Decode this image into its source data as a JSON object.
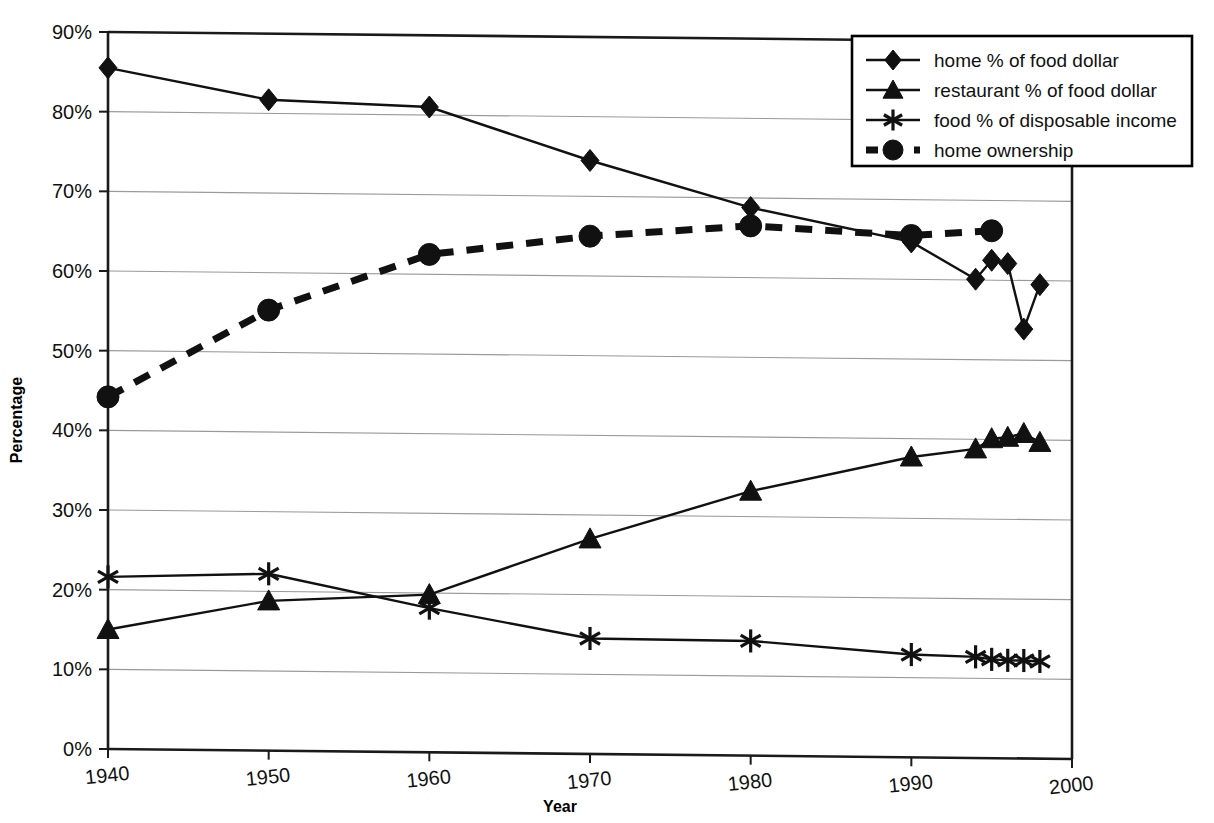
{
  "chart_data": {
    "type": "line",
    "title": "",
    "xlabel": "Year",
    "ylabel": "Percentage",
    "xlim": [
      1940,
      2000
    ],
    "ylim": [
      0,
      90
    ],
    "grid": true,
    "legend_position": "top-right",
    "x_ticks": [
      "1940",
      "1950",
      "1960",
      "1970",
      "1980",
      "1990",
      "2000"
    ],
    "y_ticks": [
      "0%",
      "10%",
      "20%",
      "30%",
      "40%",
      "50%",
      "60%",
      "70%",
      "80%",
      "90%"
    ],
    "series": [
      {
        "name": "home % of food dollar",
        "marker": "diamond",
        "style": "solid",
        "x": [
          1940,
          1950,
          1960,
          1970,
          1980,
          1990,
          1994,
          1995,
          1996,
          1997,
          1998
        ],
        "values": [
          85.5,
          81.7,
          81.0,
          74.5,
          68.8,
          64.7,
          60.1,
          62.5,
          62.1,
          53.9,
          59.5
        ]
      },
      {
        "name": "restaurant % of food dollar",
        "marker": "triangle",
        "style": "solid",
        "x": [
          1940,
          1950,
          1960,
          1970,
          1980,
          1990,
          1994,
          1995,
          1996,
          1997,
          1998
        ],
        "values": [
          15.0,
          18.8,
          19.8,
          27.0,
          33.2,
          37.7,
          38.8,
          40.1,
          40.3,
          40.8,
          39.7
        ]
      },
      {
        "name": "food % of disposable income",
        "marker": "star",
        "style": "solid",
        "x": [
          1940,
          1950,
          1960,
          1970,
          1980,
          1990,
          1994,
          1995,
          1996,
          1997,
          1998
        ],
        "values": [
          21.6,
          22.2,
          18.1,
          14.5,
          14.4,
          12.9,
          12.7,
          12.4,
          12.3,
          12.3,
          12.2
        ]
      },
      {
        "name": "home ownership",
        "marker": "circle",
        "style": "dashed",
        "x": [
          1940,
          1950,
          1960,
          1970,
          1980,
          1990,
          1995
        ],
        "values": [
          44.2,
          55.3,
          62.5,
          65.0,
          66.5,
          65.5,
          66.2
        ]
      }
    ]
  },
  "legend": {
    "items": [
      {
        "label": "home % of food dollar",
        "marker": "diamond",
        "style": "solid"
      },
      {
        "label": "restaurant % of food dollar",
        "marker": "triangle",
        "style": "solid"
      },
      {
        "label": "food % of disposable income",
        "marker": "star",
        "style": "solid"
      },
      {
        "label": "home ownership",
        "marker": "circle",
        "style": "dashed"
      }
    ]
  },
  "colors": {
    "ink": "#111111",
    "gridline": "#9a9a9a",
    "background": "#ffffff"
  }
}
